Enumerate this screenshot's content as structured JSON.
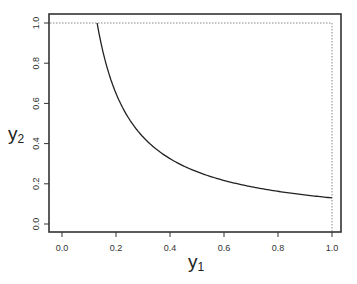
{
  "chart_data": {
    "type": "line",
    "title": "",
    "xlabel": "y1",
    "ylabel": "y2",
    "xlabel_main": "y",
    "xlabel_sub": "1",
    "ylabel_main": "y",
    "ylabel_sub": "2",
    "xlim": [
      -0.04,
      1.04
    ],
    "ylim": [
      -0.04,
      1.04
    ],
    "xticks": [
      0.0,
      0.2,
      0.4,
      0.6,
      0.8,
      1.0
    ],
    "xtick_labels": [
      "0.0",
      "0.2",
      "0.4",
      "0.6",
      "0.8",
      "1.0"
    ],
    "yticks": [
      0.0,
      0.2,
      0.4,
      0.6,
      0.8,
      1.0
    ],
    "ytick_labels": [
      "0.0",
      "0.2",
      "0.4",
      "0.6",
      "0.8",
      "1.0"
    ],
    "grid": false,
    "legend": null,
    "series": [
      {
        "name": "curve",
        "style": "solid",
        "x": [
          0.13,
          0.15,
          0.18,
          0.2,
          0.25,
          0.3,
          0.35,
          0.4,
          0.5,
          0.6,
          0.7,
          0.8,
          0.9,
          1.0
        ],
        "y": [
          1.0,
          0.867,
          0.722,
          0.65,
          0.52,
          0.433,
          0.371,
          0.325,
          0.26,
          0.217,
          0.186,
          0.163,
          0.144,
          0.13
        ]
      }
    ],
    "reference_lines": [
      {
        "type": "horizontal",
        "y": 1.0,
        "x_range": [
          -0.04,
          1.0
        ],
        "style": "dotted"
      },
      {
        "type": "vertical",
        "x": 1.0,
        "y_range": [
          -0.04,
          1.0
        ],
        "style": "dotted"
      }
    ]
  }
}
